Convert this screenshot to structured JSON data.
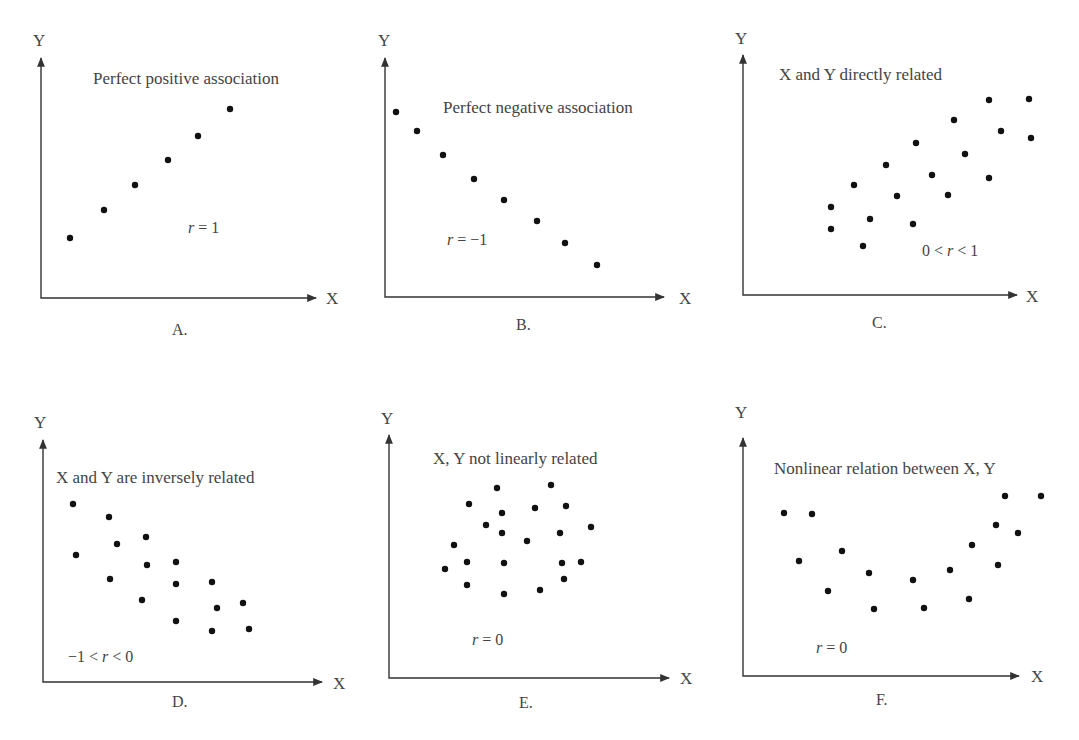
{
  "colors": {
    "axis": "#333333",
    "dot": "#111111",
    "text": "#444444",
    "background": "#ffffff"
  },
  "chart_data": [
    {
      "id": "A",
      "type": "scatter",
      "title": "Perfect positive association",
      "annotation": {
        "prefix": "",
        "var": "r",
        "suffix": " = 1"
      },
      "panel_label": "A.",
      "xlabel": "X",
      "ylabel": "Y",
      "grid": false,
      "points_px": [
        [
          70,
          238
        ],
        [
          104,
          210
        ],
        [
          135,
          185
        ],
        [
          168,
          160
        ],
        [
          198,
          136
        ],
        [
          230,
          109
        ]
      ]
    },
    {
      "id": "B",
      "type": "scatter",
      "title": "Perfect negative association",
      "annotation": {
        "prefix": "",
        "var": "r",
        "suffix": " = −1"
      },
      "panel_label": "B.",
      "xlabel": "X",
      "ylabel": "Y",
      "grid": false,
      "points_px": [
        [
          396,
          112
        ],
        [
          417,
          131
        ],
        [
          443,
          155
        ],
        [
          474,
          179
        ],
        [
          504,
          200
        ],
        [
          537,
          221
        ],
        [
          565,
          243
        ],
        [
          597,
          265
        ]
      ]
    },
    {
      "id": "C",
      "type": "scatter",
      "title": "X and Y directly related",
      "annotation": {
        "prefix": "0 < ",
        "var": "r",
        "suffix": " < 1"
      },
      "panel_label": "C.",
      "xlabel": "X",
      "ylabel": "Y",
      "grid": false,
      "points_px": [
        [
          831,
          207
        ],
        [
          831,
          229
        ],
        [
          854,
          185
        ],
        [
          863,
          246
        ],
        [
          870,
          219
        ],
        [
          886,
          165
        ],
        [
          897,
          196
        ],
        [
          913,
          224
        ],
        [
          916,
          143
        ],
        [
          932,
          175
        ],
        [
          948,
          195
        ],
        [
          954,
          120
        ],
        [
          965,
          154
        ],
        [
          989,
          100
        ],
        [
          989,
          178
        ],
        [
          1001,
          131
        ],
        [
          1029,
          99
        ],
        [
          1031,
          138
        ]
      ]
    },
    {
      "id": "D",
      "type": "scatter",
      "title": "X and Y are inversely related",
      "annotation": {
        "prefix": "−1 < ",
        "var": "r",
        "suffix": " < 0"
      },
      "panel_label": "D.",
      "xlabel": "X",
      "ylabel": "Y",
      "grid": false,
      "points_px": [
        [
          73,
          504
        ],
        [
          76,
          555
        ],
        [
          109,
          517
        ],
        [
          110,
          579
        ],
        [
          117,
          544
        ],
        [
          142,
          600
        ],
        [
          146,
          537
        ],
        [
          147,
          565
        ],
        [
          176,
          562
        ],
        [
          176,
          584
        ],
        [
          176,
          621
        ],
        [
          212,
          582
        ],
        [
          212,
          631
        ],
        [
          217,
          608
        ],
        [
          243,
          603
        ],
        [
          249,
          629
        ]
      ]
    },
    {
      "id": "E",
      "type": "scatter",
      "title": "X, Y not linearly related",
      "annotation": {
        "prefix": "",
        "var": "r",
        "suffix": " = 0"
      },
      "panel_label": "E.",
      "xlabel": "X",
      "ylabel": "Y",
      "grid": false,
      "points_px": [
        [
          445,
          569
        ],
        [
          454,
          545
        ],
        [
          467,
          562
        ],
        [
          467,
          585
        ],
        [
          469,
          504
        ],
        [
          497,
          488
        ],
        [
          486,
          525
        ],
        [
          502,
          513
        ],
        [
          502,
          533
        ],
        [
          504,
          563
        ],
        [
          504,
          594
        ],
        [
          527,
          541
        ],
        [
          535,
          508
        ],
        [
          540,
          590
        ],
        [
          551,
          485
        ],
        [
          560,
          533
        ],
        [
          562,
          563
        ],
        [
          566,
          506
        ],
        [
          564,
          579
        ],
        [
          581,
          562
        ],
        [
          591,
          527
        ]
      ]
    },
    {
      "id": "F",
      "type": "scatter",
      "title": "Nonlinear relation between X, Y",
      "annotation": {
        "prefix": "",
        "var": "r",
        "suffix": " = 0"
      },
      "panel_label": "F.",
      "xlabel": "X",
      "ylabel": "Y",
      "grid": false,
      "points_px": [
        [
          784,
          513
        ],
        [
          799,
          561
        ],
        [
          812,
          514
        ],
        [
          828,
          591
        ],
        [
          842,
          551
        ],
        [
          869,
          573
        ],
        [
          874,
          609
        ],
        [
          913,
          580
        ],
        [
          924,
          608
        ],
        [
          950,
          570
        ],
        [
          969,
          599
        ],
        [
          972,
          545
        ],
        [
          996,
          525
        ],
        [
          998,
          565
        ],
        [
          1005,
          496
        ],
        [
          1018,
          533
        ],
        [
          1041,
          496
        ]
      ]
    }
  ]
}
